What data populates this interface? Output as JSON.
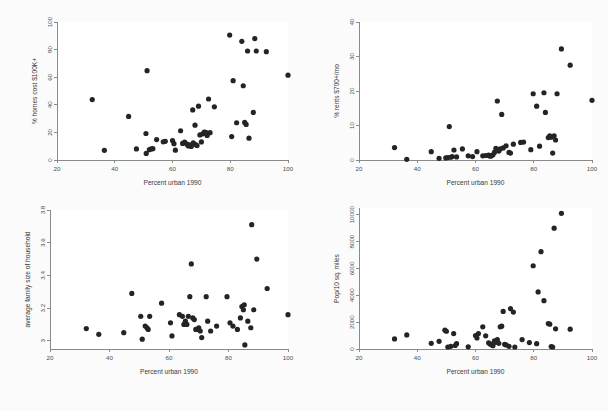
{
  "figure": {
    "background_color": "#fbfbfb",
    "panel_background_color": "#ffffff",
    "marker_color": "#242424",
    "axis_color": "#8a8a8a",
    "layout": "2x2 grid of scatter plots"
  },
  "chart_data": [
    {
      "type": "scatter",
      "title": "",
      "xlabel": "Percent urban 1990",
      "ylabel": "% homes cost $100K+",
      "xlim": [
        20,
        100
      ],
      "ylim": [
        0,
        100
      ],
      "xticks": [
        20,
        40,
        60,
        80,
        100
      ],
      "yticks": [
        0,
        20,
        40,
        60,
        80,
        100
      ],
      "grid": false,
      "legend": "none",
      "points": [
        [
          32.2,
          43.8
        ],
        [
          36.4,
          7.0
        ],
        [
          44.8,
          31.6
        ],
        [
          47.5,
          8.0
        ],
        [
          50.8,
          19.2
        ],
        [
          50.9,
          4.8
        ],
        [
          51.2,
          64.7
        ],
        [
          52.0,
          7.5
        ],
        [
          52.6,
          8.0
        ],
        [
          53.2,
          8.2
        ],
        [
          54.5,
          14.8
        ],
        [
          56.8,
          13.2
        ],
        [
          57.5,
          13.5
        ],
        [
          60.0,
          14.1
        ],
        [
          60.5,
          11.8
        ],
        [
          61.0,
          7.1
        ],
        [
          62.8,
          21.2
        ],
        [
          63.5,
          12.0
        ],
        [
          64.2,
          13.0
        ],
        [
          65.0,
          11.5
        ],
        [
          65.5,
          10.2
        ],
        [
          66.0,
          11.0
        ],
        [
          66.5,
          9.8
        ],
        [
          67.0,
          36.3
        ],
        [
          67.2,
          12.5
        ],
        [
          67.8,
          25.2
        ],
        [
          68.0,
          11.2
        ],
        [
          68.5,
          10.5
        ],
        [
          69.0,
          39.0
        ],
        [
          69.5,
          18.2
        ],
        [
          70.0,
          13.1
        ],
        [
          70.5,
          19.0
        ],
        [
          71.0,
          20.2
        ],
        [
          71.5,
          20.0
        ],
        [
          72.0,
          17.8
        ],
        [
          72.5,
          44.2
        ],
        [
          73.0,
          19.8
        ],
        [
          74.5,
          38.5
        ],
        [
          79.8,
          90.5
        ],
        [
          80.5,
          17.0
        ],
        [
          81.0,
          57.5
        ],
        [
          82.2,
          27.0
        ],
        [
          84.0,
          86.0
        ],
        [
          84.5,
          53.8
        ],
        [
          85.0,
          27.2
        ],
        [
          85.5,
          25.8
        ],
        [
          86.0,
          79.0
        ],
        [
          86.5,
          15.8
        ],
        [
          88.0,
          34.5
        ],
        [
          88.5,
          88.0
        ],
        [
          89.0,
          79.0
        ],
        [
          92.5,
          78.5
        ],
        [
          100.0,
          61.5
        ]
      ]
    },
    {
      "type": "scatter",
      "title": "",
      "xlabel": "Percent urban 1990",
      "ylabel": "% rents $700+/mo",
      "xlim": [
        20,
        100
      ],
      "ylim": [
        0,
        40
      ],
      "xticks": [
        20,
        40,
        60,
        80,
        100
      ],
      "yticks": [
        0,
        10,
        20,
        30,
        40
      ],
      "grid": false,
      "legend": "none",
      "points": [
        [
          32.2,
          3.6
        ],
        [
          36.4,
          0.2
        ],
        [
          44.8,
          2.4
        ],
        [
          47.5,
          0.5
        ],
        [
          49.8,
          0.6
        ],
        [
          50.5,
          0.7
        ],
        [
          51.0,
          9.7
        ],
        [
          51.5,
          0.8
        ],
        [
          52.0,
          1.0
        ],
        [
          52.6,
          2.9
        ],
        [
          53.5,
          0.9
        ],
        [
          55.5,
          3.2
        ],
        [
          57.5,
          1.2
        ],
        [
          59.0,
          1.0
        ],
        [
          60.5,
          2.4
        ],
        [
          62.5,
          1.2
        ],
        [
          63.5,
          1.3
        ],
        [
          64.5,
          1.4
        ],
        [
          65.0,
          1.1
        ],
        [
          65.5,
          1.2
        ],
        [
          66.0,
          1.5
        ],
        [
          66.5,
          2.2
        ],
        [
          67.0,
          3.4
        ],
        [
          67.5,
          17.1
        ],
        [
          68.0,
          2.6
        ],
        [
          68.5,
          3.2
        ],
        [
          69.0,
          13.2
        ],
        [
          69.5,
          3.5
        ],
        [
          70.5,
          4.1
        ],
        [
          71.5,
          2.2
        ],
        [
          72.0,
          2.0
        ],
        [
          73.0,
          4.6
        ],
        [
          75.5,
          5.1
        ],
        [
          76.5,
          5.2
        ],
        [
          79.0,
          3.0
        ],
        [
          79.8,
          19.2
        ],
        [
          81.0,
          15.6
        ],
        [
          82.0,
          4.0
        ],
        [
          83.5,
          19.5
        ],
        [
          84.0,
          13.8
        ],
        [
          85.0,
          6.5
        ],
        [
          85.5,
          7.0
        ],
        [
          86.0,
          6.6
        ],
        [
          86.5,
          2.0
        ],
        [
          87.0,
          7.0
        ],
        [
          87.5,
          5.8
        ],
        [
          88.0,
          19.2
        ],
        [
          89.5,
          32.2
        ],
        [
          92.5,
          27.5
        ],
        [
          100.0,
          17.3
        ]
      ]
    },
    {
      "type": "scatter",
      "title": "",
      "xlabel": "Percent urban 1990",
      "ylabel": "average family size of household",
      "xlim": [
        20,
        100
      ],
      "ylim": [
        2.95,
        3.8
      ],
      "xticks": [
        20,
        40,
        60,
        80,
        100
      ],
      "yticks": [
        3,
        3.2,
        3.4,
        3.6,
        3.8
      ],
      "ytick_labels": [
        "3",
        "3.2",
        "3.4",
        "3.6",
        "3.8"
      ],
      "grid": false,
      "legend": "none",
      "points": [
        [
          32.2,
          3.075
        ],
        [
          36.4,
          3.04
        ],
        [
          44.8,
          3.05
        ],
        [
          47.5,
          3.29
        ],
        [
          50.5,
          3.15
        ],
        [
          51.0,
          3.01
        ],
        [
          52.0,
          3.09
        ],
        [
          52.6,
          3.08
        ],
        [
          53.0,
          3.07
        ],
        [
          53.5,
          3.15
        ],
        [
          57.5,
          3.23
        ],
        [
          60.5,
          3.11
        ],
        [
          61.0,
          3.03
        ],
        [
          63.5,
          3.16
        ],
        [
          64.5,
          3.15
        ],
        [
          65.0,
          3.1
        ],
        [
          65.5,
          3.12
        ],
        [
          66.0,
          3.1
        ],
        [
          66.5,
          3.15
        ],
        [
          67.0,
          3.27
        ],
        [
          67.5,
          3.47
        ],
        [
          68.0,
          3.14
        ],
        [
          68.5,
          3.13
        ],
        [
          69.0,
          3.07
        ],
        [
          69.5,
          3.07
        ],
        [
          70.0,
          3.08
        ],
        [
          70.5,
          3.06
        ],
        [
          71.0,
          3.02
        ],
        [
          72.5,
          3.27
        ],
        [
          73.0,
          3.12
        ],
        [
          74.0,
          3.06
        ],
        [
          76.0,
          3.09
        ],
        [
          79.5,
          3.27
        ],
        [
          80.5,
          3.11
        ],
        [
          81.5,
          3.09
        ],
        [
          83.0,
          3.07
        ],
        [
          84.0,
          3.14
        ],
        [
          84.5,
          3.21
        ],
        [
          85.0,
          3.19
        ],
        [
          85.3,
          3.22
        ],
        [
          85.5,
          2.975
        ],
        [
          86.5,
          3.12
        ],
        [
          87.5,
          3.08
        ],
        [
          87.8,
          3.71
        ],
        [
          88.5,
          3.19
        ],
        [
          89.5,
          3.5
        ],
        [
          93.0,
          3.32
        ],
        [
          100.0,
          3.16
        ]
      ]
    },
    {
      "type": "scatter",
      "title": "",
      "xlabel": "Percent urban 1990",
      "ylabel": "Pop/10 sq. miles",
      "xlim": [
        20,
        100
      ],
      "ylim": [
        0,
        10500
      ],
      "xticks": [
        20,
        40,
        60,
        80,
        100
      ],
      "yticks": [
        0,
        2000,
        4000,
        6000,
        8000,
        10000
      ],
      "grid": false,
      "legend": "none",
      "points": [
        [
          32.2,
          750
        ],
        [
          36.4,
          1050
        ],
        [
          44.8,
          420
        ],
        [
          47.5,
          570
        ],
        [
          49.5,
          1400
        ],
        [
          50.0,
          1320
        ],
        [
          50.5,
          150
        ],
        [
          51.5,
          200
        ],
        [
          52.5,
          1150
        ],
        [
          53.0,
          260
        ],
        [
          53.5,
          400
        ],
        [
          57.5,
          160
        ],
        [
          60.0,
          1000
        ],
        [
          60.5,
          820
        ],
        [
          61.0,
          1150
        ],
        [
          62.5,
          1650
        ],
        [
          63.5,
          980
        ],
        [
          64.5,
          460
        ],
        [
          65.0,
          380
        ],
        [
          65.5,
          320
        ],
        [
          66.0,
          250
        ],
        [
          66.5,
          600
        ],
        [
          67.0,
          500
        ],
        [
          67.5,
          700
        ],
        [
          68.0,
          420
        ],
        [
          68.5,
          1650
        ],
        [
          69.0,
          1700
        ],
        [
          69.5,
          2800
        ],
        [
          70.0,
          350
        ],
        [
          70.5,
          300
        ],
        [
          71.5,
          200
        ],
        [
          72.0,
          3000
        ],
        [
          73.0,
          2750
        ],
        [
          73.5,
          150
        ],
        [
          76.0,
          700
        ],
        [
          78.5,
          480
        ],
        [
          79.8,
          6200
        ],
        [
          81.0,
          400
        ],
        [
          81.5,
          4250
        ],
        [
          82.5,
          7250
        ],
        [
          83.5,
          3600
        ],
        [
          85.0,
          1900
        ],
        [
          85.5,
          1850
        ],
        [
          86.0,
          180
        ],
        [
          86.5,
          150
        ],
        [
          87.0,
          9000
        ],
        [
          87.5,
          1500
        ],
        [
          89.5,
          10100
        ],
        [
          92.5,
          1480
        ]
      ]
    }
  ]
}
